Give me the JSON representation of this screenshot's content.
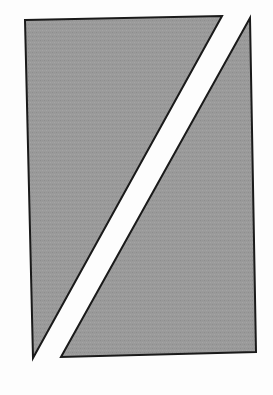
{
  "figure": {
    "canvas": {
      "width": 273,
      "height": 395,
      "background_color": "#fdfdfd"
    },
    "style": {
      "fill_color": "#969696",
      "fill_pattern": "halftone-dither",
      "stroke_color": "#1a1a1a",
      "stroke_width": 2,
      "band_color": "#ffffff"
    },
    "shapes": [
      {
        "name": "upper-left-triangle",
        "label": "Upper left triangle",
        "points": "25,20 222,16 33,358",
        "vertices": [
          {
            "x": 25,
            "y": 20
          },
          {
            "x": 222,
            "y": 16
          },
          {
            "x": 33,
            "y": 358
          }
        ],
        "fill_color": "#969696",
        "stroke_color": "#1a1a1a"
      },
      {
        "name": "lower-right-triangle",
        "label": "Lower right triangle",
        "points": "250,18 256,352 61,357",
        "vertices": [
          {
            "x": 250,
            "y": 18
          },
          {
            "x": 256,
            "y": 352
          },
          {
            "x": 61,
            "y": 357
          }
        ],
        "fill_color": "#969696",
        "stroke_color": "#1a1a1a"
      }
    ],
    "band": {
      "name": "diagonal-white-band",
      "label": "Diagonal white band",
      "points": "222,16 250,18 61,357 33,358",
      "color": "#ffffff",
      "approx_horizontal_width": 27
    }
  }
}
